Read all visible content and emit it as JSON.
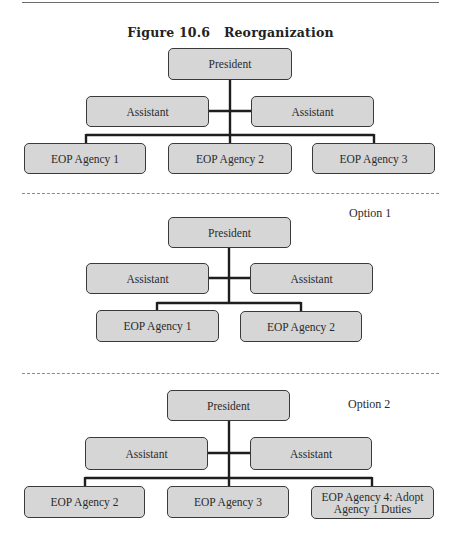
{
  "figure": {
    "title": "Figure 10.6   Reorganization"
  },
  "panels": [
    {
      "label": "",
      "president": "President",
      "assistants": [
        "Assistant",
        "Assistant"
      ],
      "agencies": [
        "EOP Agency 1",
        "EOP Agency 2",
        "EOP Agency 3"
      ]
    },
    {
      "label": "Option 1",
      "president": "President",
      "assistants": [
        "Assistant",
        "Assistant"
      ],
      "agencies": [
        "EOP Agency 1",
        "EOP Agency 2"
      ]
    },
    {
      "label": "Option 2",
      "president": "President",
      "assistants": [
        "Assistant",
        "Assistant"
      ],
      "agencies": [
        "EOP Agency 2",
        "EOP Agency 3",
        "EOP Agency 4: Adopt Agency 1 Duties"
      ],
      "agency_lines": [
        [
          "EOP Agency 2"
        ],
        [
          "EOP Agency 3"
        ],
        [
          "EOP Agency 4: Adopt",
          "Agency 1 Duties"
        ]
      ]
    }
  ],
  "colors": {
    "box_fill": "#d6d6d6",
    "box_border": "#3a3a3a",
    "connector": "#1e1e1e"
  }
}
